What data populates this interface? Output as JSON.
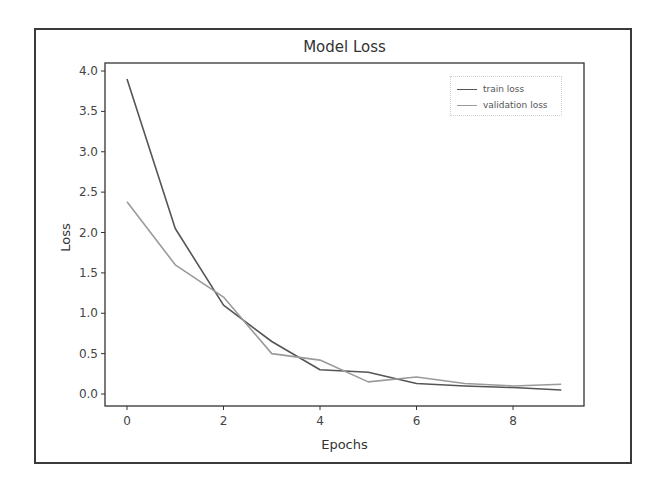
{
  "chart_data": {
    "type": "line",
    "title": "Model Loss",
    "xlabel": "Epochs",
    "ylabel": "Loss",
    "x": [
      0,
      1,
      2,
      3,
      4,
      5,
      6,
      7,
      8,
      9
    ],
    "series": [
      {
        "name": "train loss",
        "color": "#555555",
        "values": [
          3.9,
          2.05,
          1.1,
          0.65,
          0.3,
          0.27,
          0.13,
          0.1,
          0.08,
          0.05
        ]
      },
      {
        "name": "validation loss",
        "color": "#9a9a9a",
        "values": [
          2.38,
          1.6,
          1.2,
          0.5,
          0.42,
          0.15,
          0.21,
          0.13,
          0.1,
          0.12
        ]
      }
    ],
    "xticks": [
      0,
      2,
      4,
      6,
      8
    ],
    "xtick_labels": [
      "0",
      "2",
      "4",
      "6",
      "8"
    ],
    "yticks": [
      0.0,
      0.5,
      1.0,
      1.5,
      2.0,
      2.5,
      3.0,
      3.5,
      4.0
    ],
    "ytick_labels": [
      "0.0",
      "0.5",
      "1.0",
      "1.5",
      "2.0",
      "2.5",
      "3.0",
      "3.5",
      "4.0"
    ],
    "xlim": [
      -0.45,
      9.45
    ],
    "ylim": [
      -0.14,
      4.1
    ],
    "grid": false,
    "legend_position": "upper right"
  }
}
